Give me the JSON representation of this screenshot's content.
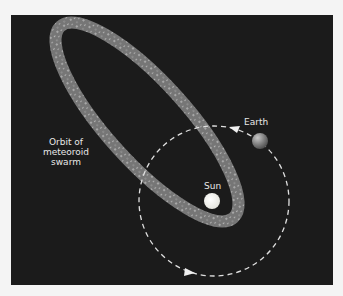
{
  "diagram": {
    "labels": {
      "orbit_line1": "Orbit of",
      "orbit_line2": "meteoroid",
      "orbit_line3": "swarm",
      "earth": "Earth",
      "sun": "Sun"
    },
    "colors": {
      "background": "#1b1b1b",
      "swarm_band": "#7a7a7a",
      "earth_orbit": "#e0e0e0",
      "sun": "#f5f5f0",
      "earth": "#8a8a8a"
    },
    "elements": [
      {
        "name": "meteoroid-swarm-orbit",
        "shape": "ellipse",
        "center": [
          147,
          122
        ],
        "rx": 129,
        "ry": 40,
        "rotation_deg": 47.9
      },
      {
        "name": "earth-orbit",
        "shape": "dashed-circle",
        "center": [
          214,
          201
        ],
        "r": 75
      },
      {
        "name": "sun",
        "shape": "circle",
        "center": [
          212,
          201
        ],
        "r": 8
      },
      {
        "name": "earth",
        "shape": "circle",
        "center": [
          260,
          141
        ],
        "r": 8
      }
    ]
  }
}
